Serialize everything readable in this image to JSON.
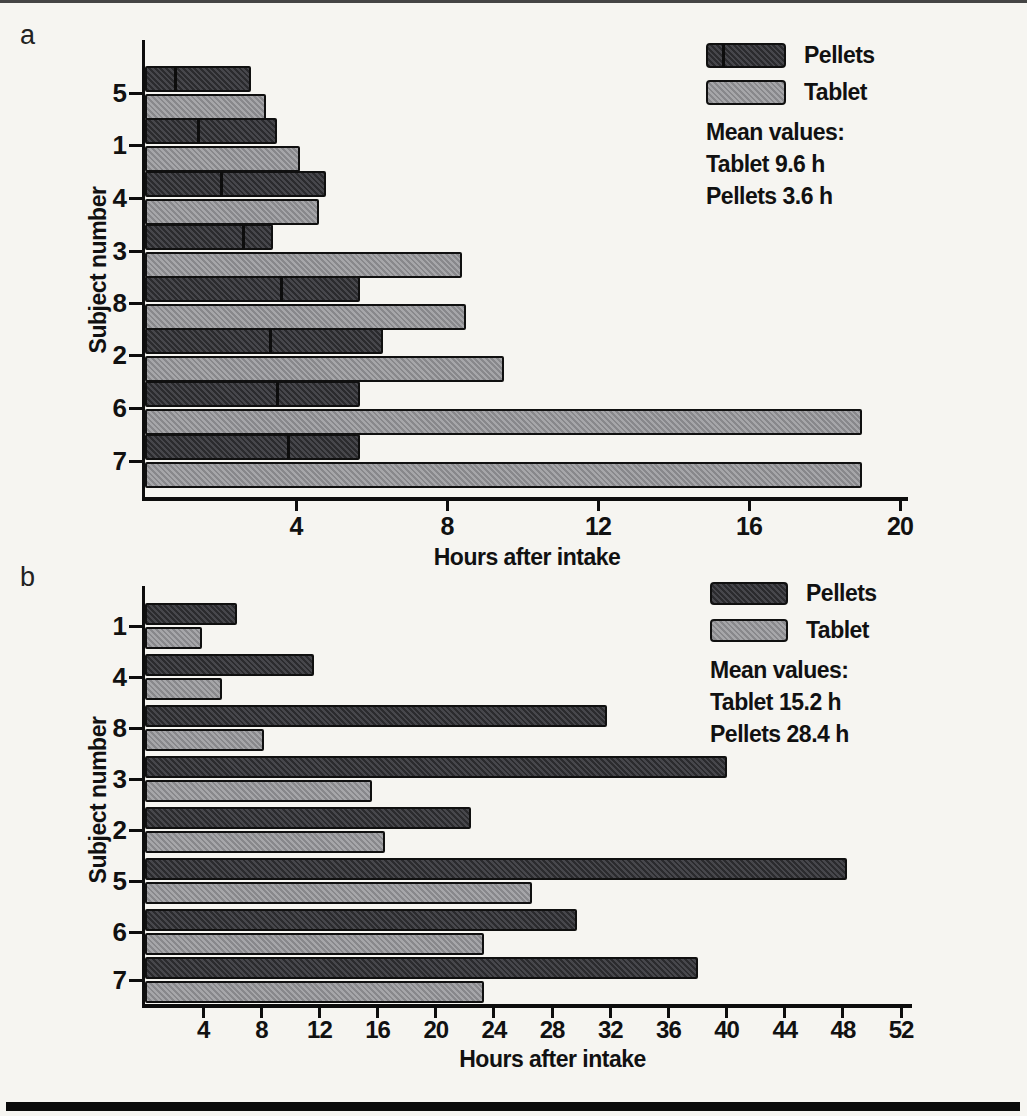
{
  "page": {
    "panel_a_label": "a",
    "panel_b_label": "b"
  },
  "colors": {
    "pellets_fill": "#3d3d42",
    "tablet_fill": "#909094",
    "bar_outline": "#101010",
    "background": "#f6f5f1"
  },
  "chart_data": [
    {
      "type": "bar",
      "panel": "a",
      "orientation": "horizontal",
      "xlabel": "Hours after intake",
      "ylabel": "Subject number",
      "xlim": [
        0,
        20
      ],
      "xticks": [
        4,
        8,
        12,
        16,
        20
      ],
      "grid": false,
      "categories": [
        "5",
        "1",
        "4",
        "3",
        "8",
        "2",
        "6",
        "7"
      ],
      "series": [
        {
          "name": "Pellets",
          "values": [
            2.8,
            3.5,
            4.8,
            3.4,
            5.7,
            6.3,
            5.7,
            5.7
          ],
          "inner_markers": [
            0.8,
            1.4,
            2.0,
            2.6,
            3.6,
            3.3,
            3.5,
            3.8
          ]
        },
        {
          "name": "Tablet",
          "values": [
            3.2,
            4.1,
            4.6,
            8.4,
            8.5,
            9.5,
            19.0,
            19.0
          ]
        }
      ],
      "legend_position": "top-right",
      "annotations": [
        "Mean values:",
        "Tablet 9.6 h",
        "Pellets 3.6 h"
      ]
    },
    {
      "type": "bar",
      "panel": "b",
      "orientation": "horizontal",
      "xlabel": "Hours after intake",
      "ylabel": "Subject number",
      "xlim": [
        0,
        52
      ],
      "xticks": [
        4,
        8,
        12,
        16,
        20,
        24,
        28,
        32,
        36,
        40,
        44,
        48,
        52
      ],
      "grid": false,
      "categories": [
        "1",
        "4",
        "8",
        "3",
        "2",
        "5",
        "6",
        "7"
      ],
      "series": [
        {
          "name": "Pellets",
          "values": [
            6.3,
            11.6,
            31.8,
            40.0,
            22.4,
            48.3,
            29.7,
            38.0
          ]
        },
        {
          "name": "Tablet",
          "values": [
            3.9,
            5.3,
            8.2,
            15.6,
            16.5,
            26.6,
            23.3,
            23.3
          ]
        }
      ],
      "legend_position": "top-right",
      "annotations": [
        "Mean values:",
        "Tablet 15.2 h",
        "Pellets 28.4 h"
      ]
    }
  ]
}
